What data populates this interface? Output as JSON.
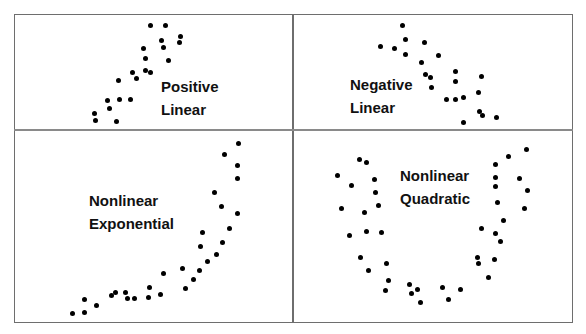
{
  "figure": {
    "panels": [
      {
        "id": "positive-linear",
        "label_lines": [
          "Positive",
          "Linear"
        ],
        "label_pos": [
          161,
          75
        ],
        "points": [
          [
            150,
            25
          ],
          [
            165,
            25
          ],
          [
            180,
            36
          ],
          [
            179,
            42
          ],
          [
            161,
            40
          ],
          [
            163,
            47
          ],
          [
            143,
            48
          ],
          [
            145,
            58
          ],
          [
            168,
            60
          ],
          [
            132,
            72
          ],
          [
            145,
            70
          ],
          [
            150,
            72
          ],
          [
            118,
            80
          ],
          [
            136,
            78
          ],
          [
            107,
            100
          ],
          [
            119,
            99
          ],
          [
            130,
            99
          ],
          [
            94,
            113
          ],
          [
            109,
            108
          ],
          [
            95,
            120
          ],
          [
            116,
            121
          ]
        ]
      },
      {
        "id": "negative-linear",
        "label_lines": [
          "Negative",
          "Linear"
        ],
        "label_pos": [
          350,
          73
        ],
        "points": [
          [
            402,
            25
          ],
          [
            405,
            39
          ],
          [
            424,
            42
          ],
          [
            380,
            46
          ],
          [
            394,
            48
          ],
          [
            405,
            54
          ],
          [
            438,
            55
          ],
          [
            421,
            62
          ],
          [
            425,
            74
          ],
          [
            430,
            77
          ],
          [
            455,
            71
          ],
          [
            455,
            81
          ],
          [
            481,
            76
          ],
          [
            431,
            87
          ],
          [
            478,
            92
          ],
          [
            446,
            99
          ],
          [
            455,
            99
          ],
          [
            463,
            97
          ],
          [
            479,
            111
          ],
          [
            482,
            115
          ],
          [
            496,
            117
          ],
          [
            463,
            122
          ]
        ]
      },
      {
        "id": "nonlinear-exponential",
        "label_lines": [
          "Nonlinear",
          "Exponential"
        ],
        "label_pos": [
          89,
          189
        ],
        "points": [
          [
            238,
            143
          ],
          [
            224,
            154
          ],
          [
            237,
            165
          ],
          [
            237,
            178
          ],
          [
            214,
            192
          ],
          [
            221,
            206
          ],
          [
            237,
            213
          ],
          [
            229,
            228
          ],
          [
            202,
            232
          ],
          [
            200,
            246
          ],
          [
            222,
            242
          ],
          [
            216,
            254
          ],
          [
            207,
            261
          ],
          [
            182,
            268
          ],
          [
            199,
            270
          ],
          [
            193,
            279
          ],
          [
            185,
            288
          ],
          [
            163,
            273
          ],
          [
            160,
            294
          ],
          [
            149,
            287
          ],
          [
            148,
            297
          ],
          [
            134,
            298
          ],
          [
            127,
            298
          ],
          [
            125,
            292
          ],
          [
            115,
            292
          ],
          [
            111,
            295
          ],
          [
            96,
            305
          ],
          [
            84,
            299
          ],
          [
            84,
            312
          ],
          [
            72,
            313
          ]
        ]
      },
      {
        "id": "nonlinear-quadratic",
        "label_lines": [
          "Nonlinear",
          "Quadratic"
        ],
        "label_pos": [
          400,
          164
        ],
        "points": [
          [
            359,
            159
          ],
          [
            366,
            162
          ],
          [
            337,
            175
          ],
          [
            351,
            185
          ],
          [
            374,
            179
          ],
          [
            375,
            192
          ],
          [
            341,
            208
          ],
          [
            364,
            212
          ],
          [
            378,
            205
          ],
          [
            349,
            235
          ],
          [
            366,
            231
          ],
          [
            381,
            232
          ],
          [
            360,
            257
          ],
          [
            368,
            270
          ],
          [
            386,
            263
          ],
          [
            388,
            280
          ],
          [
            385,
            290
          ],
          [
            409,
            284
          ],
          [
            411,
            293
          ],
          [
            417,
            289
          ],
          [
            420,
            302
          ],
          [
            442,
            287
          ],
          [
            448,
            299
          ],
          [
            460,
            289
          ],
          [
            495,
            164
          ],
          [
            508,
            156
          ],
          [
            526,
            149
          ],
          [
            495,
            177
          ],
          [
            495,
            186
          ],
          [
            519,
            178
          ],
          [
            527,
            190
          ],
          [
            497,
            202
          ],
          [
            524,
            208
          ],
          [
            503,
            220
          ],
          [
            481,
            228
          ],
          [
            495,
            233
          ],
          [
            500,
            241
          ],
          [
            477,
            257
          ],
          [
            478,
            263
          ],
          [
            494,
            259
          ],
          [
            488,
            277
          ]
        ]
      }
    ]
  },
  "chart_data": [
    {
      "type": "scatter",
      "title": "Positive Linear",
      "trend": "positive linear",
      "x": [],
      "y": []
    },
    {
      "type": "scatter",
      "title": "Negative Linear",
      "trend": "negative linear",
      "x": [],
      "y": []
    },
    {
      "type": "scatter",
      "title": "Nonlinear Exponential",
      "trend": "exponential growth",
      "x": [],
      "y": []
    },
    {
      "type": "scatter",
      "title": "Nonlinear Quadratic",
      "trend": "U-shaped quadratic",
      "x": [],
      "y": []
    }
  ],
  "colors": {
    "dot": "#000000",
    "border": "#6e6e6e",
    "label": "#111111"
  }
}
